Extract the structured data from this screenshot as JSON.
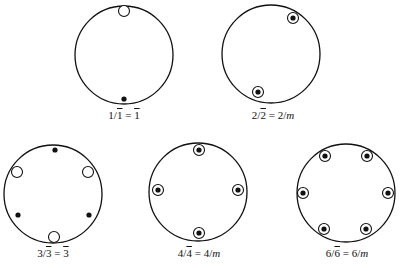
{
  "figure": {
    "type": "stereographic-projections",
    "colors": {
      "stroke": "#111111",
      "background": "#ffffff"
    },
    "legend_semantics": {
      "filled-dot": "pole above projection plane",
      "open-circle": "pole below projection plane",
      "circled-dot": "coincident poles above and below"
    },
    "panels": [
      {
        "id": "p1",
        "label_parts": {
          "a": "1/",
          "b": "1",
          "c": " = ",
          "d": "1",
          "e": ""
        },
        "label_text": "1/1̄ = 1̄",
        "center": [
          124,
          55
        ],
        "radius": 49,
        "label_pos": [
          124,
          115
        ],
        "markers": [
          {
            "kind": "open-circle",
            "pos": [
              124,
              11
            ]
          },
          {
            "kind": "filled-dot",
            "pos": [
              124,
              99
            ]
          }
        ]
      },
      {
        "id": "p2",
        "label_parts": {
          "a": "2/",
          "b": "2",
          "c": " = 2/",
          "d": "",
          "e": "m"
        },
        "label_text": "2/2̄ = 2/m",
        "center": [
          271,
          54
        ],
        "radius": 49,
        "label_pos": [
          273,
          115
        ],
        "markers": [
          {
            "kind": "circled-dot",
            "pos": [
              293,
              18
            ]
          },
          {
            "kind": "circled-dot",
            "pos": [
              258,
              92
            ]
          }
        ]
      },
      {
        "id": "p3",
        "label_parts": {
          "a": "3/",
          "b": "3",
          "c": " = ",
          "d": "3",
          "e": ""
        },
        "label_text": "3/3̄ = 3̄",
        "center": [
          53,
          194
        ],
        "radius": 49,
        "label_pos": [
          53,
          253
        ],
        "markers": [
          {
            "kind": "filled-dot",
            "pos": [
              55,
              150
            ]
          },
          {
            "kind": "open-circle",
            "pos": [
              17,
              172
            ]
          },
          {
            "kind": "open-circle",
            "pos": [
              88,
              172
            ]
          },
          {
            "kind": "filled-dot",
            "pos": [
              18,
              215
            ]
          },
          {
            "kind": "filled-dot",
            "pos": [
              89,
              215
            ]
          },
          {
            "kind": "open-circle",
            "pos": [
              54,
              237
            ]
          }
        ]
      },
      {
        "id": "p4",
        "label_parts": {
          "a": "4/",
          "b": "4",
          "c": " = 4/",
          "d": "",
          "e": "m"
        },
        "label_text": "4/4̄ = 4/m",
        "center": [
          198,
          192
        ],
        "radius": 49,
        "label_pos": [
          199,
          253
        ],
        "markers": [
          {
            "kind": "circled-dot",
            "pos": [
              199,
              150
            ]
          },
          {
            "kind": "circled-dot",
            "pos": [
              158,
              190
            ]
          },
          {
            "kind": "circled-dot",
            "pos": [
              238,
              190
            ]
          },
          {
            "kind": "circled-dot",
            "pos": [
              199,
              233
            ]
          }
        ]
      },
      {
        "id": "p5",
        "label_parts": {
          "a": "6/",
          "b": "6",
          "c": " = 6/",
          "d": "",
          "e": "m"
        },
        "label_text": "6/6̄ = 6/m",
        "center": [
          346,
          193
        ],
        "radius": 49,
        "label_pos": [
          347,
          253
        ],
        "markers": [
          {
            "kind": "circled-dot",
            "pos": [
              325,
              156
            ]
          },
          {
            "kind": "circled-dot",
            "pos": [
              367,
              156
            ]
          },
          {
            "kind": "circled-dot",
            "pos": [
              303,
              193
            ]
          },
          {
            "kind": "circled-dot",
            "pos": [
              388,
              193
            ]
          },
          {
            "kind": "circled-dot",
            "pos": [
              324,
              229
            ]
          },
          {
            "kind": "circled-dot",
            "pos": [
              366,
              229
            ]
          }
        ]
      }
    ]
  }
}
